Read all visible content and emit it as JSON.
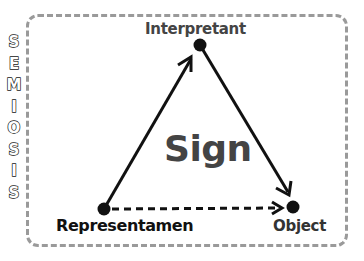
{
  "title_vertical": "SEMIOSIS",
  "letters": [
    "S",
    "E",
    "M",
    "I",
    "O",
    "S",
    "I",
    "S"
  ],
  "center_label": "Sign",
  "nodes": {
    "interpretant": {
      "label": "Interpretant",
      "x": 200,
      "y": 45
    },
    "representamen": {
      "label": "Representamen",
      "x": 104,
      "y": 209
    },
    "object": {
      "label": "Object",
      "x": 293,
      "y": 207
    }
  },
  "edges": [
    {
      "from": "representamen",
      "to": "interpretant",
      "style": "solid",
      "arrow": true
    },
    {
      "from": "interpretant",
      "to": "object",
      "style": "solid",
      "arrow": true
    },
    {
      "from": "representamen",
      "to": "object",
      "style": "dashed",
      "arrow": true
    }
  ],
  "colors": {
    "frame": "#9a9a9a",
    "line": "#111111",
    "text": "#444444"
  }
}
